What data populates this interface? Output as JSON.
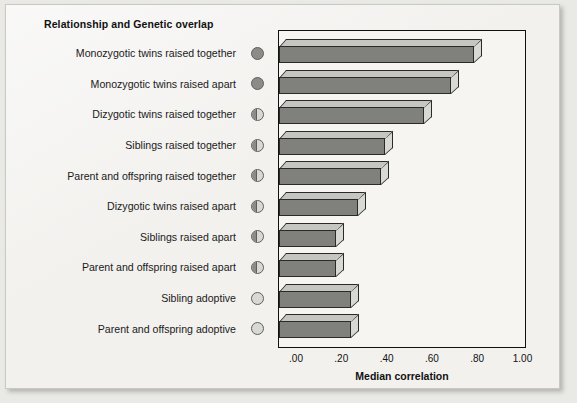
{
  "chart_title": "Relationship and Genetic overlap",
  "x_axis_title": "Median correlation",
  "x_ticks": [
    ".00",
    ".20",
    ".40",
    ".60",
    ".80",
    "1.00"
  ],
  "colors": {
    "paper": "#f2f1ee",
    "bar_front": "#80807d",
    "bar_top": "#c5c5c1",
    "bar_side": "#d8d8d4",
    "outline": "#2a2a2a",
    "symbol_fill": "#8b8b88",
    "symbol_empty": "#d9d9d4"
  },
  "categories": [
    {
      "label": "Monozygotic twins raised together",
      "overlap": "full"
    },
    {
      "label": "Monozygotic twins raised apart",
      "overlap": "full"
    },
    {
      "label": "Dizygotic twins raised together",
      "overlap": "half"
    },
    {
      "label": "Siblings raised together",
      "overlap": "half"
    },
    {
      "label": "Parent and offspring raised together",
      "overlap": "half"
    },
    {
      "label": "Dizygotic twins raised apart",
      "overlap": "half"
    },
    {
      "label": "Siblings raised apart",
      "overlap": "half"
    },
    {
      "label": "Parent and offspring raised apart",
      "overlap": "half"
    },
    {
      "label": "Sibling adoptive",
      "overlap": "empty"
    },
    {
      "label": "Parent and offspring adoptive",
      "overlap": "empty"
    }
  ],
  "chart_data": {
    "type": "bar",
    "orientation": "horizontal",
    "title": "Relationship and Genetic overlap",
    "xlabel": "Median correlation",
    "ylabel": "",
    "xlim": [
      0.0,
      1.0
    ],
    "xticks": [
      0.0,
      0.2,
      0.4,
      0.6,
      0.8,
      1.0
    ],
    "xticklabels": [
      ".00",
      ".20",
      ".40",
      ".60",
      ".80",
      "1.00"
    ],
    "grid": false,
    "legend": "none",
    "style": "3d-shaded-bars",
    "categories": [
      "Monozygotic twins raised together",
      "Monozygotic twins raised apart",
      "Dizygotic twins raised together",
      "Siblings raised together",
      "Parent and offspring raised together",
      "Dizygotic twins raised apart",
      "Siblings raised apart",
      "Parent and offspring raised apart",
      "Sibling adoptive",
      "Parent and offspring adoptive"
    ],
    "values": [
      0.86,
      0.76,
      0.64,
      0.47,
      0.45,
      0.35,
      0.25,
      0.25,
      0.32,
      0.32
    ],
    "genetic_overlap_symbol": [
      "full",
      "full",
      "half",
      "half",
      "half",
      "half",
      "half",
      "half",
      "empty",
      "empty"
    ]
  }
}
